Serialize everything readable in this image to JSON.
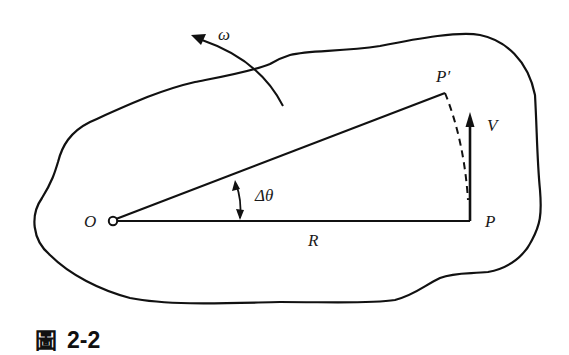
{
  "figure": {
    "caption_char": "圖",
    "caption_number": "2-2"
  },
  "labels": {
    "omega": "ω",
    "origin": "O",
    "point_p": "P",
    "point_p_prime": "P′",
    "velocity": "V",
    "delta_theta": "Δθ",
    "radius": "R"
  },
  "colors": {
    "stroke": "#111111",
    "background": "#ffffff"
  }
}
